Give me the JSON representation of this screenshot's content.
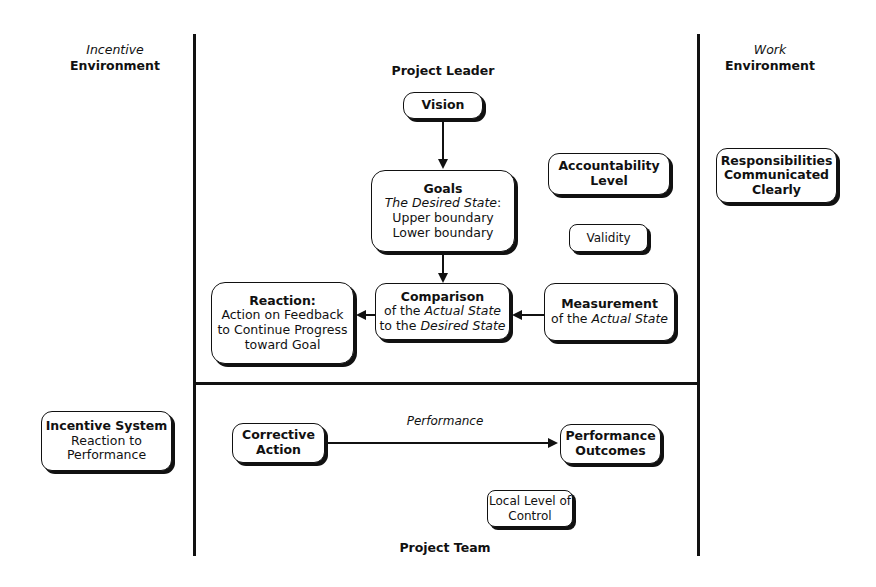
{
  "regions": {
    "incentive_env": {
      "line1": "Incentive",
      "line2": "Environment"
    },
    "work_env": {
      "line1": "Work",
      "line2": "Environment"
    },
    "project_leader": "Project Leader",
    "project_team": "Project Team"
  },
  "nodes": {
    "vision": {
      "title": "Vision"
    },
    "goals": {
      "title": "Goals",
      "subtitle_italic": "The Desired State",
      "subtitle_suffix": ":",
      "line3": "Upper boundary",
      "line4": "Lower boundary"
    },
    "accountability": {
      "line1": "Accountability",
      "line2": "Level"
    },
    "validity": {
      "title": "Validity"
    },
    "responsibilities": {
      "line1": "Responsibilities",
      "line2": "Communicated",
      "line3": "Clearly"
    },
    "comparison": {
      "title": "Comparison",
      "l2_prefix": "of the ",
      "l2_italic": "Actual State",
      "l3_prefix": "to the ",
      "l3_italic": "Desired State"
    },
    "measurement": {
      "title": "Measurement",
      "l2_prefix": "of the ",
      "l2_italic": "Actual State"
    },
    "reaction": {
      "title": "Reaction:",
      "line2": "Action on Feedback",
      "line3": "to Continue Progress",
      "line4": "toward Goal"
    },
    "incentive_system": {
      "title": "Incentive System",
      "line2": "Reaction to",
      "line3": "Performance"
    },
    "corrective_action": {
      "line1": "Corrective",
      "line2": "Action"
    },
    "performance_outcomes": {
      "line1": "Performance",
      "line2": "Outcomes"
    },
    "local_control": {
      "line1": "Local Level of",
      "line2": "Control"
    }
  },
  "edges": {
    "performance_label": "Performance"
  }
}
